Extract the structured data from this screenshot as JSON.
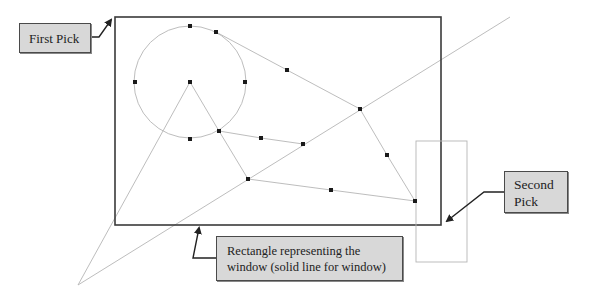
{
  "diagram": {
    "callouts": {
      "first_pick": {
        "label": "First Pick"
      },
      "second_pick": {
        "lines": [
          "Second",
          "Pick"
        ]
      },
      "window": {
        "lines": [
          "Rectangle representing the",
          "window (solid line for window)"
        ]
      }
    },
    "colors": {
      "window_border": "#3a3a3a",
      "geometry_line": "#b5b5b5",
      "grip_point": "#1a1a1a",
      "callout_fill": "#d8d8d8",
      "callout_border": "#4a4a4a"
    },
    "shapes": {
      "window_rectangle": {
        "x": 115,
        "y": 17,
        "width": 326,
        "height": 208
      },
      "small_rectangle": {
        "x": 416,
        "y": 141,
        "width": 51,
        "height": 121
      },
      "circle": {
        "cx": 190,
        "cy": 82,
        "r": 56
      },
      "grip_points": [
        [
          190,
          26
        ],
        [
          216,
          32
        ],
        [
          135,
          82
        ],
        [
          190,
          82
        ],
        [
          245,
          82
        ],
        [
          190,
          139
        ],
        [
          287,
          70
        ],
        [
          360,
          109
        ],
        [
          219,
          131
        ],
        [
          261,
          138
        ],
        [
          303,
          144
        ],
        [
          387,
          155
        ],
        [
          248,
          179
        ],
        [
          331,
          190
        ],
        [
          415,
          201
        ]
      ]
    }
  }
}
